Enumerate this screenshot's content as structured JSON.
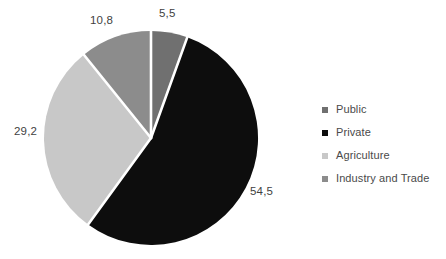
{
  "chart_data": {
    "type": "pie",
    "title": "",
    "categories": [
      "Public",
      "Private",
      "Agriculture",
      "Industry and Trade"
    ],
    "values": [
      5.5,
      54.5,
      29.2,
      10.8
    ],
    "value_labels": [
      "5,5",
      "54,5",
      "29,2",
      "10,8"
    ],
    "colors": [
      "#707070",
      "#0d0d0d",
      "#c8c8c8",
      "#8c8c8c"
    ],
    "label_position": "outside",
    "slice_separator_color": "#ffffff",
    "start_angle_deg": 0,
    "direction": "clockwise",
    "grid": false,
    "legend_position": "right",
    "xlabel": "",
    "ylabel": ""
  },
  "labels": {
    "public": "5,5",
    "private": "54,5",
    "agriculture": "29,2",
    "industry": "10,8"
  },
  "legend": {
    "items": [
      {
        "label": "Public",
        "color": "#707070"
      },
      {
        "label": "Private",
        "color": "#0d0d0d"
      },
      {
        "label": "Agriculture",
        "color": "#c8c8c8"
      },
      {
        "label": "Industry and Trade",
        "color": "#8c8c8c"
      }
    ]
  }
}
